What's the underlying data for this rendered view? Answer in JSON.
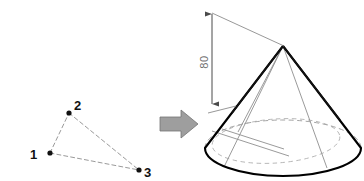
{
  "figure": {
    "background_color": "#ffffff"
  },
  "left_panel": {
    "name": "three-point-triangle",
    "line_style": "dashed",
    "line_color": "#9a9a9a",
    "dot_color": "#111111",
    "points": [
      {
        "label": "1",
        "x": 50,
        "y": 153,
        "label_x": 30,
        "label_y": 159,
        "label_side": "left"
      },
      {
        "label": "2",
        "x": 69,
        "y": 113,
        "label_x": 74,
        "label_y": 110,
        "label_side": "upper-right"
      },
      {
        "label": "3",
        "x": 139,
        "y": 170,
        "label_x": 144,
        "label_y": 177,
        "label_side": "right"
      }
    ]
  },
  "arrow": {
    "name": "transform-arrow",
    "direction": "right",
    "fill_color": "#9e9e9e",
    "stroke_color": "#6e6e6e"
  },
  "right_panel": {
    "name": "cone-drawing",
    "outline_color": "#000000",
    "construction_color": "#8a8a8a",
    "hidden_line_color": "#9a9a9a",
    "apex": {
      "x": 283,
      "y": 46
    },
    "base_center": {
      "x": 283,
      "y": 148
    },
    "base_rx": 78,
    "base_ry": 28
  },
  "dimension": {
    "name": "height-dimension",
    "value": "80",
    "orientation": "vertical",
    "text_rotation_deg": -90,
    "line_color": "#7a7a7a",
    "line_x": 212,
    "top_y": 12,
    "bottom_y": 105
  }
}
